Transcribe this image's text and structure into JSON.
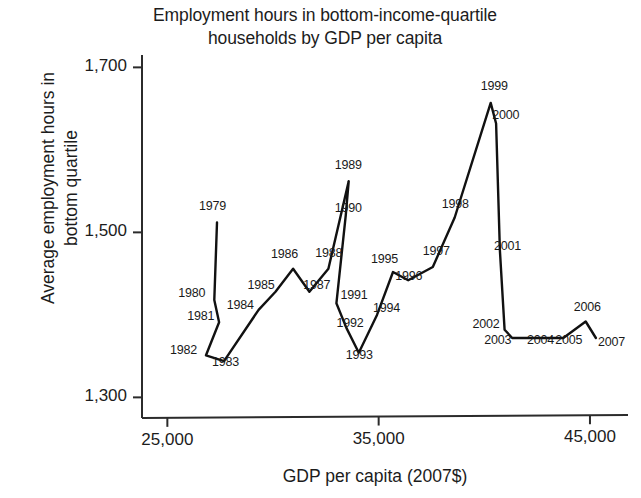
{
  "chart_data": {
    "type": "line",
    "title": "Employment hours in bottom-income-quartile households by GDP per capita",
    "title_line1": "Employment hours in bottom-income-quartile",
    "title_line2": "households by GDP per capita",
    "xlabel": "GDP per capita (2007$)",
    "ylabel": "Average employment hours in bottom quartile",
    "ylabel_line1": "Average employment hours in",
    "ylabel_line2": "bottom quartile",
    "xlim": [
      23800,
      46800
    ],
    "ylim": [
      1275,
      1715
    ],
    "xticks": [
      25000,
      35000,
      45000
    ],
    "xtick_labels": [
      "25,000",
      "35,000",
      "45,000"
    ],
    "yticks": [
      1300,
      1500,
      1700
    ],
    "ytick_labels": [
      "1,300",
      "1,500",
      "1,700"
    ],
    "grid": false,
    "legend": "none",
    "line_color": "#111111",
    "point_label_key": "year",
    "points": [
      {
        "year": "1979",
        "x": 27350,
        "y": 1512,
        "lx": -18,
        "ly": -16
      },
      {
        "year": "1980",
        "x": 27220,
        "y": 1418,
        "lx": -36,
        "ly": -7
      },
      {
        "year": "1981",
        "x": 27450,
        "y": 1391,
        "lx": -32,
        "ly": -6
      },
      {
        "year": "1982",
        "x": 26830,
        "y": 1351,
        "lx": -36,
        "ly": -5
      },
      {
        "year": "1983",
        "x": 27680,
        "y": 1344,
        "lx": -12,
        "ly": 1
      },
      {
        "year": "1984",
        "x": 29320,
        "y": 1406,
        "lx": -32,
        "ly": -5
      },
      {
        "year": "1985",
        "x": 30120,
        "y": 1428,
        "lx": -28,
        "ly": -7
      },
      {
        "year": "1986",
        "x": 30950,
        "y": 1456,
        "lx": -22,
        "ly": -15
      },
      {
        "year": "1987",
        "x": 31720,
        "y": 1428,
        "lx": -6,
        "ly": -7
      },
      {
        "year": "1988",
        "x": 32620,
        "y": 1456,
        "lx": -13,
        "ly": -16
      },
      {
        "year": "1989",
        "x": 33580,
        "y": 1562,
        "lx": -14,
        "ly": -16
      },
      {
        "year": "1990",
        "x": 33440,
        "y": 1520,
        "lx": -11,
        "ly": -8
      },
      {
        "year": "1991",
        "x": 33000,
        "y": 1414,
        "lx": 4,
        "ly": -8
      },
      {
        "year": "1992",
        "x": 33480,
        "y": 1384,
        "lx": -10,
        "ly": -5
      },
      {
        "year": "1993",
        "x": 34060,
        "y": 1354,
        "lx": -13,
        "ly": 2
      },
      {
        "year": "1994",
        "x": 34920,
        "y": 1400,
        "lx": -4,
        "ly": -7
      },
      {
        "year": "1995",
        "x": 35680,
        "y": 1452,
        "lx": -22,
        "ly": -13
      },
      {
        "year": "1996",
        "x": 36400,
        "y": 1442,
        "lx": -13,
        "ly": -4
      },
      {
        "year": "1997",
        "x": 37560,
        "y": 1458,
        "lx": -10,
        "ly": -16
      },
      {
        "year": "1998",
        "x": 38600,
        "y": 1518,
        "lx": -13,
        "ly": -14
      },
      {
        "year": "1999",
        "x": 40300,
        "y": 1657,
        "lx": -10,
        "ly": -17
      },
      {
        "year": "2000",
        "x": 40560,
        "y": 1632,
        "lx": -4,
        "ly": -8
      },
      {
        "year": "2001",
        "x": 40740,
        "y": 1478,
        "lx": -6,
        "ly": -5
      },
      {
        "year": "2002",
        "x": 40960,
        "y": 1382,
        "lx": -32,
        "ly": -6
      },
      {
        "year": "2003",
        "x": 41320,
        "y": 1372,
        "lx": -28,
        "ly": 2
      },
      {
        "year": "2004",
        "x": 42640,
        "y": 1372,
        "lx": -13,
        "ly": 2
      },
      {
        "year": "2005",
        "x": 43740,
        "y": 1372,
        "lx": -8,
        "ly": 2
      },
      {
        "year": "2006",
        "x": 44800,
        "y": 1392,
        "lx": -12,
        "ly": -14
      },
      {
        "year": "2007",
        "x": 45280,
        "y": 1372,
        "lx": 2,
        "ly": 4
      }
    ]
  }
}
